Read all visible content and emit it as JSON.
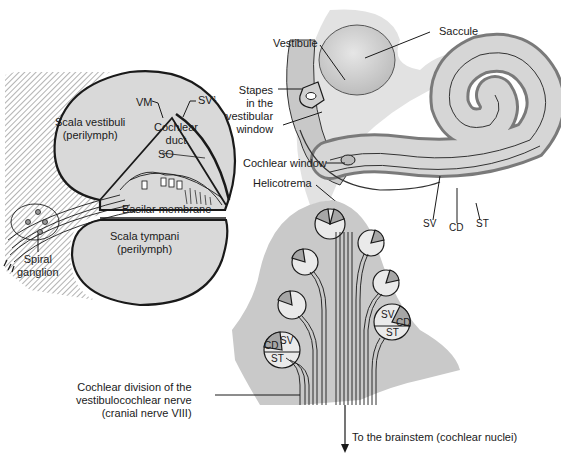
{
  "colors": {
    "fill_gray": "#d9d9d9",
    "fill_mid": "#c4c4c4",
    "fill_dark": "#a6a6a6",
    "outline": "#1a1a1a",
    "background": "#ffffff"
  },
  "cross_section": {
    "scala_vestibuli": {
      "line1": "Scala vestibuli",
      "line2": "(perilymph)"
    },
    "cochlear_duct": {
      "line1": "Cochlear",
      "line2": "duct"
    },
    "scala_tympani": {
      "line1": "Scala tympani",
      "line2": "(perilymph)"
    },
    "vm": "VM",
    "sv1": "SV",
    "sv1_sup": "1",
    "so": "SO",
    "basilar_membrane": "Basilar membrane",
    "spiral_ganglion": {
      "line1": "Spiral",
      "line2": "ganglion"
    }
  },
  "cochlea_overview": {
    "vestibule": "Vestibule",
    "saccule": "Saccule",
    "stapes": {
      "line1": "Stapes",
      "line2": "in the",
      "line3": "vestibular",
      "line4": "window"
    },
    "cochlear_window": "Cochlear window",
    "helicotrema": "Helicotrema",
    "sv": "SV",
    "cd": "CD",
    "st": "ST"
  },
  "modiolus_section": {
    "left_turn": {
      "sv": "SV",
      "cd": "CD",
      "st": "ST"
    },
    "right_turn": {
      "sv": "SV",
      "cd": "CD",
      "st": "ST"
    },
    "nerve": {
      "line1": "Cochlear division of the",
      "line2": "vestibulocochlear nerve",
      "line3": "(cranial nerve VIII)"
    },
    "brainstem": "To the brainstem (cochlear nuclei)"
  }
}
